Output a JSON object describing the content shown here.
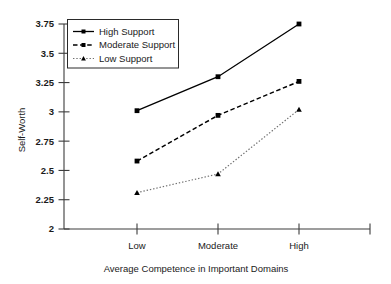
{
  "chart_data": {
    "type": "line",
    "title": "",
    "xlabel": "Average Competence in Important Domains",
    "ylabel": "Self-Worth",
    "categories": [
      "Low",
      "Moderate",
      "High"
    ],
    "ylim": [
      2,
      3.75
    ],
    "yticks": [
      "2",
      "2.25",
      "2.5",
      "2.75",
      "3",
      "3.25",
      "3.5",
      "3.75"
    ],
    "ytick_values": [
      2,
      2.25,
      2.5,
      2.75,
      3,
      3.25,
      3.5,
      3.75
    ],
    "grid": false,
    "legend_position": "top-left",
    "series": [
      {
        "name": "High Support",
        "values": [
          3.01,
          3.3,
          3.75
        ],
        "line_style": "solid",
        "marker": "square",
        "color": "#000000"
      },
      {
        "name": "Moderate Support",
        "values": [
          2.58,
          2.97,
          3.26
        ],
        "line_style": "dashed",
        "marker": "square",
        "color": "#000000"
      },
      {
        "name": "Low Support",
        "values": [
          2.31,
          2.47,
          3.02
        ],
        "line_style": "dotted",
        "marker": "triangle",
        "color": "#6f6f6f"
      }
    ]
  },
  "axes": {
    "y_axis_label": "Self-Worth",
    "x_axis_label": "Average Competence in Important Domains"
  },
  "legend": {
    "entries": [
      {
        "label": "High Support"
      },
      {
        "label": "Moderate Support"
      },
      {
        "label": "Low Support"
      }
    ]
  }
}
